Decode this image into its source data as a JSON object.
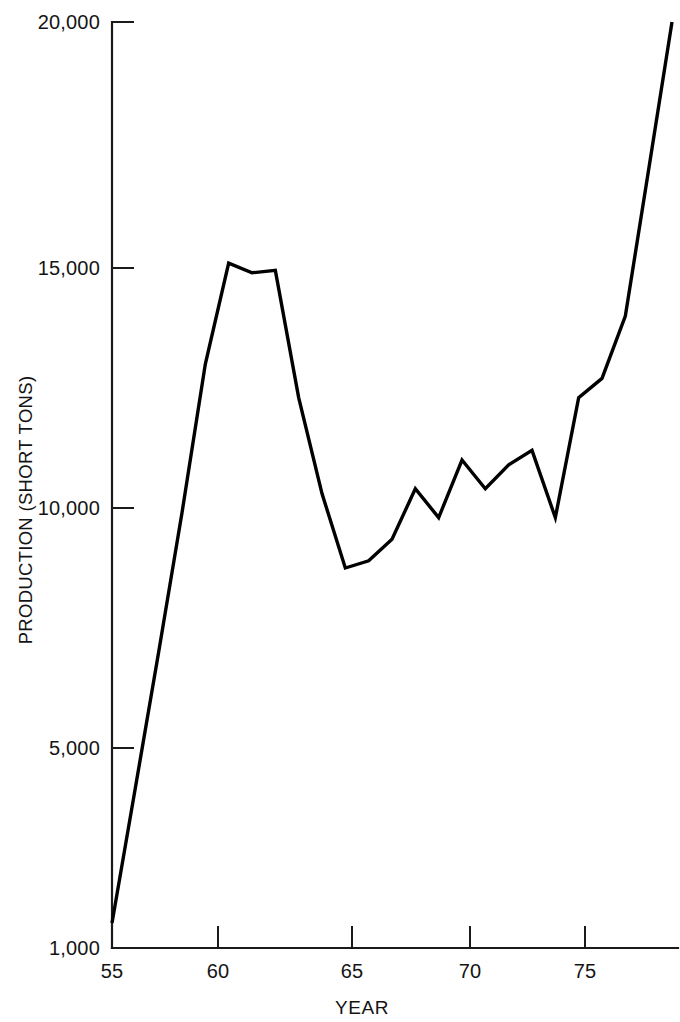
{
  "chart_data": {
    "type": "line",
    "title": "",
    "xlabel": "YEAR",
    "ylabel": "PRODUCTION (SHORT TONS)",
    "x": [
      1955,
      1956,
      1957,
      1958,
      1959,
      1960,
      1961,
      1962,
      1963,
      1964,
      1965,
      1966,
      1967,
      1968,
      1969,
      1970,
      1971,
      1972,
      1973,
      1974,
      1975,
      1976,
      1977,
      1978,
      1979
    ],
    "x_tick_labels": [
      "55",
      "60",
      "65",
      "70",
      "75"
    ],
    "x_tick_values": [
      1955,
      1960,
      1965,
      1970,
      1975
    ],
    "y_tick_labels": [
      "1,000",
      "5,000",
      "10,000",
      "15,000",
      "20,000"
    ],
    "y_tick_values": [
      1000,
      5000,
      10000,
      15000,
      20000
    ],
    "values": [
      1500,
      4200,
      7000,
      9900,
      13000,
      15100,
      14900,
      14950,
      12300,
      10300,
      8750,
      8900,
      9350,
      10400,
      9800,
      11000,
      10400,
      10900,
      11200,
      9800,
      12300,
      12700,
      14000,
      17000,
      20000
    ],
    "series": [
      {
        "name": "Production",
        "values": [
          1500,
          4200,
          7000,
          9900,
          13000,
          15100,
          14900,
          14950,
          12300,
          10300,
          8750,
          8900,
          9350,
          10400,
          9800,
          11000,
          10400,
          10900,
          11200,
          9800,
          12300,
          12700,
          14000,
          17000,
          20000
        ]
      }
    ],
    "xlim": [
      1955,
      1979
    ],
    "ylim": [
      1000,
      20000
    ],
    "grid": false,
    "legend": false,
    "line_color": "#000000",
    "line_width": 3.4,
    "axis_color": "#1a1a1a",
    "background_color": "#ffffff",
    "y_axis_note": "Irregular/compressed scale below 5,000"
  },
  "axis": {
    "y_label": "PRODUCTION (SHORT TONS)",
    "x_label": "YEAR",
    "y_ticks": [
      {
        "label": "20,000",
        "value": 20000
      },
      {
        "label": "15,000",
        "value": 15000
      },
      {
        "label": "10,000",
        "value": 10000
      },
      {
        "label": "5,000",
        "value": 5000
      },
      {
        "label": "1,000",
        "value": 1000
      }
    ],
    "x_ticks": [
      {
        "label": "55",
        "value": 1955
      },
      {
        "label": "60",
        "value": 1960
      },
      {
        "label": "65",
        "value": 1965
      },
      {
        "label": "70",
        "value": 1970
      },
      {
        "label": "75",
        "value": 1975
      }
    ]
  }
}
